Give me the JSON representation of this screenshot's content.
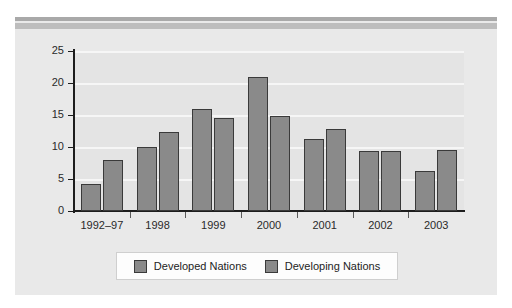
{
  "figure": {
    "background_color": "#ffffff",
    "panel_color": "#e9e9e9",
    "band_color": "#a9a9a9",
    "band_sub_color": "#bdbdbd"
  },
  "chart_data": {
    "type": "bar",
    "title": "",
    "subtitle": "",
    "xlabel": "",
    "ylabel": "",
    "categories": [
      "1992–97",
      "1998",
      "1999",
      "2000",
      "2001",
      "2002",
      "2003"
    ],
    "series": [
      {
        "name": "Developed Nations",
        "color": "#8a8a8a",
        "values": [
          4.2,
          10.0,
          16.0,
          21.0,
          11.3,
          9.4,
          6.2
        ]
      },
      {
        "name": "Developing Nations",
        "color": "#8a8a8a",
        "values": [
          8.0,
          12.3,
          14.5,
          14.9,
          12.8,
          9.4,
          9.6
        ]
      }
    ],
    "ylim": [
      0,
      25
    ],
    "yticks": [
      0,
      5,
      10,
      15,
      20,
      25
    ],
    "ytick_labels": [
      "0",
      "5",
      "10",
      "15",
      "20",
      "25"
    ],
    "grid": true,
    "grid_axis": "y",
    "grid_color": "#f6f6f6",
    "legend_position": "bottom",
    "bar_edge_color": "#3a3a3a",
    "plot_background": "#e4e4e4",
    "axis_color": "#1d1d1d"
  },
  "legend": {
    "items": [
      {
        "label": "Developed Nations"
      },
      {
        "label": "Developing Nations"
      }
    ]
  }
}
